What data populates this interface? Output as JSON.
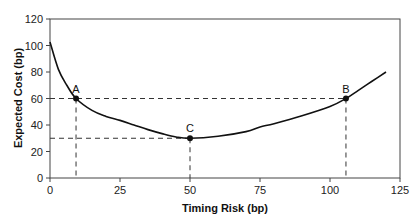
{
  "chart_data": {
    "type": "line",
    "title": "",
    "xlabel": "Timing Risk (bp)",
    "ylabel": "Expected Cost (bp)",
    "xlim": [
      0,
      125
    ],
    "ylim": [
      0,
      120
    ],
    "xticks": [
      0,
      25,
      50,
      75,
      100,
      125
    ],
    "yticks": [
      0,
      20,
      40,
      60,
      80,
      100,
      120
    ],
    "grid": false,
    "legend": null,
    "series": [
      {
        "name": "Expected Cost vs Timing Risk",
        "x": [
          0,
          3,
          6,
          9.3,
          15,
          20,
          25,
          30,
          35,
          40,
          45,
          50,
          60,
          70,
          75,
          80,
          90,
          100,
          105.7,
          110,
          115,
          120
        ],
        "y": [
          102.6,
          82,
          70,
          60,
          51,
          46.5,
          43.5,
          40,
          36.5,
          33.5,
          31,
          30,
          31.5,
          35,
          38.5,
          41,
          47,
          54,
          60,
          66,
          73,
          80
        ]
      }
    ],
    "annotations": [
      {
        "label": "A",
        "x": 9.3,
        "y": 60,
        "marker": "dot",
        "guides": "dashed to both axes"
      },
      {
        "label": "B",
        "x": 105.7,
        "y": 60,
        "marker": "dot",
        "guides": "dashed to both axes"
      },
      {
        "label": "C",
        "x": 50,
        "y": 30,
        "marker": "dot",
        "guides": "dashed to both axes"
      }
    ]
  },
  "labels": {
    "xlabel": "Timing Risk (bp)",
    "ylabel": "Expected Cost (bp)",
    "xticks": [
      "0",
      "25",
      "50",
      "75",
      "100",
      "125"
    ],
    "yticks": [
      "0",
      "20",
      "40",
      "60",
      "80",
      "100",
      "120"
    ],
    "point_a": "A",
    "point_b": "B",
    "point_c": "C"
  }
}
